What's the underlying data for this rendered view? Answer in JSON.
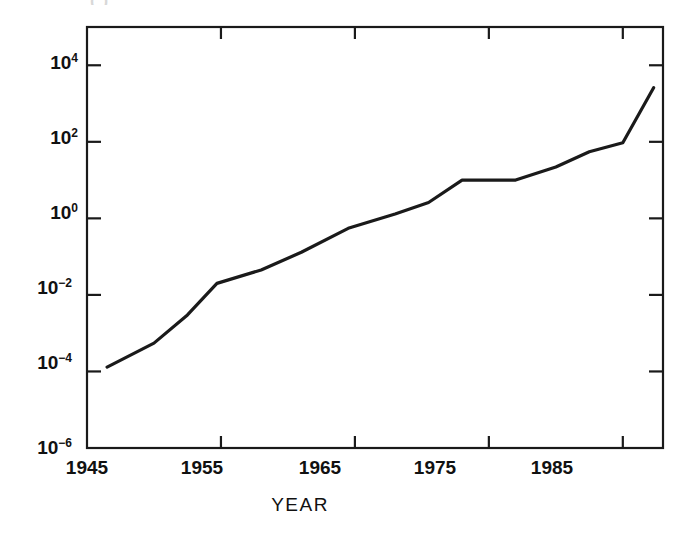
{
  "figure": {
    "title_fragment": "( )",
    "background": "#ffffff",
    "ink_color": "#111111",
    "line_color": "#1a1a1a"
  },
  "chart_data": {
    "type": "line",
    "title": "",
    "xlabel": "YEAR",
    "ylabel": "",
    "yscale": "log",
    "xlim": [
      1945,
      1988
    ],
    "ylim": [
      1e-06,
      100000
    ],
    "grid": false,
    "legend": null,
    "x_ticks": [
      1945,
      1955,
      1965,
      1975,
      1985
    ],
    "x_tick_labels": [
      "1945",
      "1955",
      "1965",
      "1975",
      "1985"
    ],
    "y_ticks": [
      1e-06,
      0.0001,
      0.01,
      1,
      100,
      10000
    ],
    "y_tick_labels": [
      "10⁻⁶",
      "10⁻⁴",
      "10⁻²",
      "10⁰",
      "10²",
      "10⁴"
    ],
    "y_tick_mantissas": [
      "10",
      "10",
      "10",
      "10",
      "10",
      "10"
    ],
    "y_tick_exponents": [
      "-6",
      "-4",
      "-2",
      "0",
      "2",
      "4"
    ],
    "series": [
      {
        "name": "series-1",
        "x": [
          1946.5,
          1950.0,
          1952.5,
          1954.7,
          1958.0,
          1961.0,
          1964.5,
          1968.0,
          1970.5,
          1973.0,
          1977.0,
          1980.0,
          1982.5,
          1985.0,
          1987.3
        ],
        "y": [
          0.00013,
          0.00055,
          0.003,
          0.02,
          0.045,
          0.13,
          0.55,
          1.3,
          2.6,
          10.0,
          10.0,
          22.0,
          55.0,
          95.0,
          2600.0
        ]
      }
    ]
  },
  "axis_labels": {
    "x_axis_title": "YEAR"
  }
}
